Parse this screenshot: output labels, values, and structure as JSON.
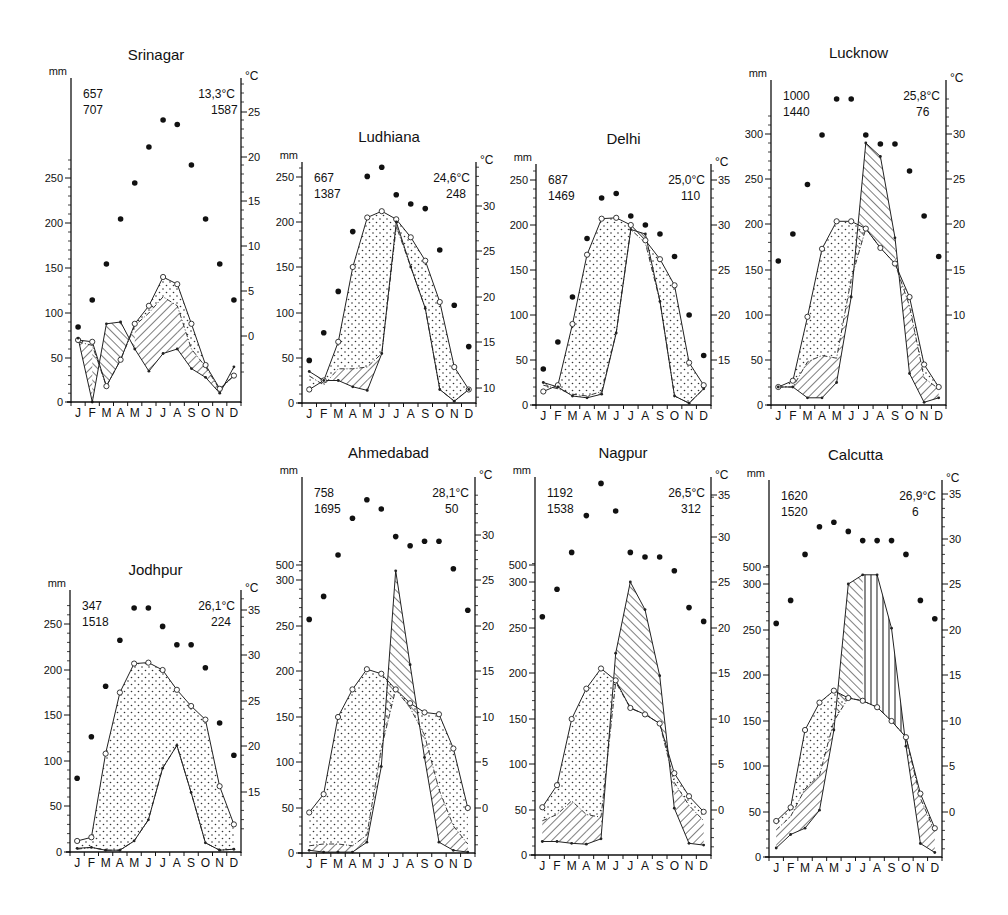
{
  "page": {
    "figure_description": "Climate diagrams of Indian stations",
    "month_labels": [
      "J",
      "F",
      "M",
      "A",
      "M",
      "J",
      "J",
      "A",
      "S",
      "O",
      "N",
      "D"
    ],
    "left_axis_unit": "mm",
    "right_axis_unit": "°C"
  },
  "chart_data": [
    {
      "type": "line",
      "title": "Srinagar",
      "ylabel_left": "mm",
      "ylabel_right": "°C",
      "annotations": {
        "top_left_1": "657",
        "top_left_2": "707",
        "top_right_1": "13,3°C",
        "top_right_2": "1587"
      },
      "left_ticks": [
        0,
        50,
        100,
        150,
        200,
        250
      ],
      "right_ticks": [
        0,
        5,
        10,
        15,
        20,
        25
      ],
      "ylim_mm": [
        0,
        300
      ],
      "categories": [
        "J",
        "F",
        "M",
        "A",
        "M",
        "J",
        "J",
        "A",
        "S",
        "O",
        "N",
        "D"
      ],
      "series": [
        {
          "name": "temperature_dots_C",
          "values": [
            1,
            4,
            8,
            13,
            17,
            21,
            24,
            23.5,
            19,
            13,
            8,
            4
          ]
        },
        {
          "name": "potential_evapotranspiration_mm",
          "values": [
            70,
            68,
            18,
            48,
            88,
            108,
            140,
            132,
            88,
            42,
            15,
            30
          ]
        },
        {
          "name": "actual_evapotranspiration_mm",
          "values": [
            68,
            64,
            18,
            48,
            86,
            100,
            118,
            108,
            60,
            40,
            14,
            30
          ]
        },
        {
          "name": "precipitation_mm",
          "values": [
            72,
            0,
            88,
            90,
            60,
            35,
            55,
            60,
            38,
            28,
            10,
            40
          ]
        }
      ]
    },
    {
      "type": "line",
      "title": "Ludhiana",
      "ylabel_left": "mm",
      "ylabel_right": "°C",
      "annotations": {
        "top_left_1": "667",
        "top_left_2": "1387",
        "top_right_1": "24,6°C",
        "top_right_2": "248"
      },
      "left_ticks": [
        0,
        50,
        100,
        150,
        200,
        250
      ],
      "right_ticks": [
        10,
        15,
        20,
        25,
        30
      ],
      "ylim_mm": [
        0,
        260
      ],
      "categories": [
        "J",
        "F",
        "M",
        "A",
        "M",
        "J",
        "J",
        "A",
        "S",
        "O",
        "N",
        "D"
      ],
      "series": [
        {
          "name": "temperature_dots_C",
          "values": [
            13,
            16,
            20.5,
            27,
            33,
            34,
            31,
            30,
            29.5,
            25,
            19,
            14.5
          ]
        },
        {
          "name": "potential_evapotranspiration_mm",
          "values": [
            15,
            25,
            68,
            150,
            205,
            212,
            203,
            183,
            157,
            112,
            40,
            15
          ]
        },
        {
          "name": "actual_evapotranspiration_mm",
          "values": [
            30,
            20,
            38,
            38,
            40,
            55,
            195,
            150,
            105,
            15,
            2,
            15
          ]
        },
        {
          "name": "precipitation_mm",
          "values": [
            35,
            25,
            25,
            18,
            14,
            55,
            200,
            150,
            105,
            15,
            2,
            15
          ]
        }
      ]
    },
    {
      "type": "line",
      "title": "Delhi",
      "ylabel_left": "mm",
      "ylabel_right": "°C",
      "annotations": {
        "top_left_1": "687",
        "top_left_2": "1469",
        "top_right_1": "25,0°C",
        "top_right_2": "110"
      },
      "left_ticks": [
        0,
        50,
        100,
        150,
        200,
        250
      ],
      "right_ticks": [
        15,
        20,
        25,
        30,
        35
      ],
      "ylim_mm": [
        0,
        260
      ],
      "categories": [
        "J",
        "F",
        "M",
        "A",
        "M",
        "J",
        "J",
        "A",
        "S",
        "O",
        "N",
        "D"
      ],
      "series": [
        {
          "name": "temperature_dots_C",
          "values": [
            14,
            17,
            22,
            28.5,
            33,
            33.5,
            31,
            30,
            29,
            26.5,
            20,
            15.5
          ]
        },
        {
          "name": "potential_evapotranspiration_mm",
          "values": [
            15,
            22,
            90,
            167,
            207,
            208,
            200,
            183,
            162,
            133,
            47,
            22
          ]
        },
        {
          "name": "actual_evapotranspiration_mm",
          "values": [
            22,
            18,
            12,
            10,
            15,
            80,
            195,
            180,
            115,
            10,
            2,
            18
          ]
        },
        {
          "name": "precipitation_mm",
          "values": [
            25,
            20,
            10,
            8,
            12,
            80,
            195,
            190,
            115,
            10,
            2,
            18
          ]
        }
      ]
    },
    {
      "type": "line",
      "title": "Lucknow",
      "ylabel_left": "mm",
      "ylabel_right": "°C",
      "annotations": {
        "top_left_1": "1000",
        "top_left_2": "1440",
        "top_right_1": "25,8°C",
        "top_right_2": "76"
      },
      "left_ticks": [
        0,
        50,
        100,
        150,
        200,
        250,
        300
      ],
      "right_ticks": [
        10,
        15,
        20,
        25,
        30
      ],
      "ylim_mm": [
        0,
        360
      ],
      "categories": [
        "J",
        "F",
        "M",
        "A",
        "M",
        "J",
        "J",
        "A",
        "S",
        "O",
        "N",
        "D"
      ],
      "series": [
        {
          "name": "temperature_dots_C",
          "values": [
            16,
            19,
            24.5,
            30,
            34,
            34,
            30,
            29,
            29,
            26,
            21,
            16.5
          ]
        },
        {
          "name": "potential_evapotranspiration_mm",
          "values": [
            20,
            27,
            98,
            173,
            203,
            203,
            195,
            174,
            157,
            120,
            45,
            20
          ]
        },
        {
          "name": "actual_evapotranspiration_mm",
          "values": [
            20,
            20,
            48,
            55,
            52,
            140,
            195,
            174,
            157,
            110,
            30,
            18
          ]
        },
        {
          "name": "precipitation_mm",
          "values": [
            20,
            20,
            8,
            8,
            25,
            120,
            290,
            275,
            185,
            35,
            3,
            8
          ]
        }
      ]
    },
    {
      "type": "line",
      "title": "Jodhpur",
      "ylabel_left": "mm",
      "ylabel_right": "°C",
      "annotations": {
        "top_left_1": "347",
        "top_left_2": "1518",
        "top_right_1": "26,1°C",
        "top_right_2": "224"
      },
      "left_ticks": [
        0,
        50,
        100,
        150,
        200,
        250
      ],
      "right_ticks": [
        15,
        20,
        25,
        30,
        35
      ],
      "ylim_mm": [
        0,
        280
      ],
      "categories": [
        "J",
        "F",
        "M",
        "A",
        "M",
        "J",
        "J",
        "A",
        "S",
        "O",
        "N",
        "D"
      ],
      "series": [
        {
          "name": "temperature_dots_C",
          "values": [
            16.5,
            21,
            26.5,
            31.5,
            35,
            35,
            33,
            31,
            31,
            28.5,
            22.5,
            19
          ]
        },
        {
          "name": "potential_evapotranspiration_mm",
          "values": [
            12,
            16,
            108,
            175,
            207,
            208,
            200,
            178,
            160,
            145,
            72,
            30
          ]
        },
        {
          "name": "actual_evapotranspiration_mm",
          "values": [
            3,
            5,
            2,
            2,
            12,
            35,
            92,
            117,
            65,
            10,
            2,
            3
          ]
        },
        {
          "name": "precipitation_mm",
          "values": [
            4,
            5,
            2,
            2,
            12,
            35,
            92,
            117,
            65,
            10,
            2,
            3
          ]
        }
      ]
    },
    {
      "type": "line",
      "title": "Ahmedabad",
      "ylabel_left": "mm",
      "ylabel_right": "°C",
      "annotations": {
        "top_left_1": "758",
        "top_left_2": "1695",
        "top_right_1": "28,1°C",
        "top_right_2": "50"
      },
      "left_ticks": [
        0,
        50,
        100,
        150,
        200,
        250,
        300,
        500
      ],
      "right_ticks": [
        0,
        5,
        10,
        15,
        20,
        25,
        30
      ],
      "ylim_mm": [
        0,
        500
      ],
      "categories": [
        "J",
        "F",
        "M",
        "A",
        "M",
        "J",
        "J",
        "A",
        "S",
        "O",
        "N",
        "D"
      ],
      "series": [
        {
          "name": "temperature_dots_C",
          "values": [
            20.5,
            23,
            27.5,
            31.5,
            33.5,
            32.5,
            29.5,
            28.5,
            29,
            29,
            26,
            21.5
          ]
        },
        {
          "name": "potential_evapotranspiration_mm",
          "values": [
            45,
            65,
            150,
            180,
            202,
            197,
            180,
            165,
            155,
            153,
            115,
            50
          ]
        },
        {
          "name": "actual_evapotranspiration_mm",
          "values": [
            8,
            10,
            10,
            8,
            20,
            115,
            180,
            160,
            130,
            70,
            30,
            10
          ]
        },
        {
          "name": "precipitation_mm",
          "values": [
            3,
            1,
            1,
            1,
            12,
            95,
            310,
            207,
            105,
            12,
            3,
            1
          ]
        }
      ]
    },
    {
      "type": "line",
      "title": "Nagpur",
      "ylabel_left": "mm",
      "ylabel_right": "°C",
      "annotations": {
        "top_left_1": "1192",
        "top_left_2": "1538",
        "top_right_1": "26,5°C",
        "top_right_2": "312"
      },
      "left_ticks": [
        0,
        50,
        100,
        150,
        200,
        250,
        300,
        500
      ],
      "right_ticks": [
        0,
        5,
        10,
        15,
        20,
        25,
        30,
        35
      ],
      "ylim_mm": [
        0,
        500
      ],
      "categories": [
        "J",
        "F",
        "M",
        "A",
        "M",
        "J",
        "J",
        "A",
        "S",
        "O",
        "N",
        "D"
      ],
      "series": [
        {
          "name": "temperature_dots_C",
          "values": [
            21,
            24,
            28,
            32,
            35.5,
            32.5,
            28,
            27.5,
            27.5,
            26,
            22,
            20.5
          ]
        },
        {
          "name": "potential_evapotranspiration_mm",
          "values": [
            53,
            77,
            150,
            183,
            205,
            192,
            162,
            155,
            145,
            90,
            65,
            48
          ]
        },
        {
          "name": "actual_evapotranspiration_mm",
          "values": [
            38,
            45,
            60,
            45,
            42,
            190,
            162,
            155,
            145,
            80,
            55,
            38
          ]
        },
        {
          "name": "precipitation_mm",
          "values": [
            15,
            15,
            13,
            12,
            18,
            222,
            300,
            270,
            197,
            52,
            13,
            11
          ]
        }
      ]
    },
    {
      "type": "line",
      "title": "Calcutta",
      "ylabel_left": "mm",
      "ylabel_right": "°C",
      "annotations": {
        "top_left_1": "1620",
        "top_left_2": "1520",
        "top_right_1": "26,9°C",
        "top_right_2": "6"
      },
      "left_ticks": [
        0,
        50,
        100,
        150,
        200,
        250,
        300,
        500
      ],
      "right_ticks": [
        0,
        5,
        10,
        15,
        20,
        25,
        30,
        35
      ],
      "ylim_mm": [
        0,
        500
      ],
      "categories": [
        "J",
        "F",
        "M",
        "A",
        "M",
        "J",
        "J",
        "A",
        "S",
        "O",
        "N",
        "D"
      ],
      "series": [
        {
          "name": "temperature_dots_C",
          "values": [
            20.5,
            23,
            28,
            31,
            31.5,
            30.5,
            29.5,
            29.5,
            29.5,
            28,
            23,
            21
          ]
        },
        {
          "name": "potential_evapotranspiration_mm",
          "values": [
            40,
            55,
            140,
            170,
            183,
            175,
            172,
            165,
            150,
            132,
            70,
            32
          ]
        },
        {
          "name": "actual_evapotranspiration_mm",
          "values": [
            30,
            45,
            75,
            90,
            150,
            175,
            172,
            165,
            150,
            132,
            65,
            28
          ]
        },
        {
          "name": "precipitation_mm",
          "values": [
            10,
            25,
            32,
            52,
            140,
            300,
            310,
            310,
            252,
            122,
            15,
            5
          ]
        }
      ]
    }
  ]
}
